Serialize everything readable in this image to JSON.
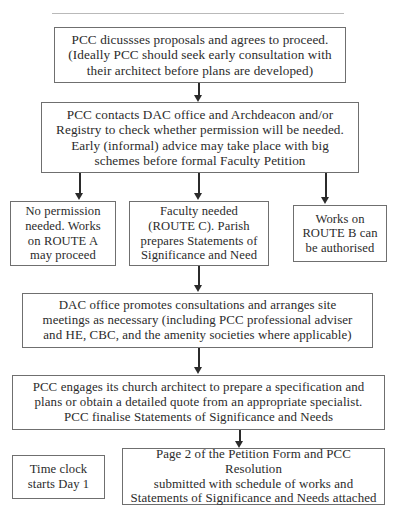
{
  "diagram": {
    "colors": {
      "background": "#ffffff",
      "box_border": "#6f6f6f",
      "text": "#2b2b2b",
      "connector": "#2b2b2b"
    },
    "nodes": [
      {
        "id": "proposals",
        "name": "pcc-discusses-proposals",
        "text": "PCC dicussses proposals and agrees to proceed.\n(Ideally PCC should seek early consultation with\ntheir architect before plans are developed)"
      },
      {
        "id": "contacts",
        "name": "pcc-contacts-dac",
        "text": "PCC contacts DAC office and Archdeacon and/or\nRegistry to check whether permission will be needed.\nEarly (informal) advice may take place with big\nschemes before formal Faculty Petition"
      },
      {
        "id": "nopermit",
        "name": "no-permission-route-a",
        "text": "No permission\nneeded. Works\non ROUTE A\nmay proceed"
      },
      {
        "id": "faculty",
        "name": "faculty-needed-route-c",
        "text": "Faculty needed\n(ROUTE C). Parish\nprepares Statements of\nSignificance and Need"
      },
      {
        "id": "routeb",
        "name": "works-route-b-authorised",
        "text": "Works on\nROUTE B can\nbe authorised"
      },
      {
        "id": "dac",
        "name": "dac-office-consultations",
        "text": "DAC office promotes consultations and arranges site\nmeetings as necessary (including PCC professional adviser\nand HE, CBC, and the amenity societies where applicable)"
      },
      {
        "id": "engages",
        "name": "pcc-engages-architect",
        "text": "PCC engages its church architect to prepare a specification and\nplans or obtain a detailed quote from an appropriate specialist.\nPCC finalise Statements of Significance and Needs"
      },
      {
        "id": "timeclock",
        "name": "time-clock-starts",
        "text": "Time clock\nstarts Day 1"
      },
      {
        "id": "page2",
        "name": "petition-form-page-2",
        "text": "Page 2 of the Petition Form and PCC Resolution\nsubmitted with schedule of works and\nStatements of Significance and Needs attached"
      }
    ],
    "connectors": [
      {
        "name": "arrow-proposals-to-contacts",
        "from": "proposals",
        "to": "contacts"
      },
      {
        "name": "arrow-contacts-to-no-permission",
        "from": "contacts",
        "to": "nopermit"
      },
      {
        "name": "arrow-contacts-to-faculty",
        "from": "contacts",
        "to": "faculty"
      },
      {
        "name": "arrow-contacts-to-route-b",
        "from": "contacts",
        "to": "routeb"
      },
      {
        "name": "arrow-faculty-to-dac",
        "from": "faculty",
        "to": "dac"
      },
      {
        "name": "arrow-dac-to-engages",
        "from": "dac",
        "to": "engages"
      },
      {
        "name": "arrow-engages-to-page-2",
        "from": "engages",
        "to": "page2"
      }
    ]
  }
}
